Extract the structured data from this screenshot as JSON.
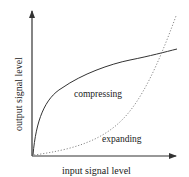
{
  "diagram": {
    "title": "",
    "x_axis_label": "input signal level",
    "y_axis_label": "output signal level",
    "curves": [
      {
        "name": "compressing",
        "label": "compressing",
        "style": "solid",
        "shape": "concave (logarithmic-like)"
      },
      {
        "name": "expanding",
        "label": "expanding",
        "style": "dotted",
        "shape": "convex (exponential-like)"
      }
    ],
    "colors": {
      "axis": "#333333",
      "compressing": "#333333",
      "expanding": "#888888",
      "text": "#1a1a1a"
    }
  }
}
